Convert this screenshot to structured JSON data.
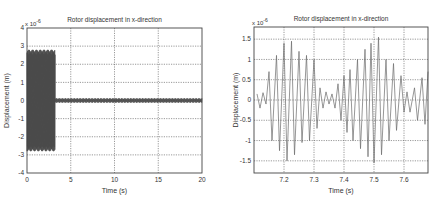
{
  "chart_data": [
    {
      "type": "line",
      "title": "Rotor displacement in x-direction",
      "xlabel": "Time (s)",
      "ylabel": "Displacement (m)",
      "y_multiplier": "x 10^-6",
      "xlim": [
        0,
        20
      ],
      "ylim": [
        -4,
        4
      ],
      "xticks": [
        0,
        5,
        10,
        15,
        20
      ],
      "yticks": [
        4,
        3,
        2,
        1,
        0,
        -1,
        -2,
        -3,
        -4
      ],
      "grid": true,
      "description": "Dense high-frequency oscillation with amplitude about ±2.8e-6 m from t=0 to ~3.2 s, then abruptly drops to a small residual oscillation of about ±0.1e-6 m until t=20 s",
      "segments": [
        {
          "t_start": 0,
          "t_end": 3.2,
          "amplitude": 2.8
        },
        {
          "t_start": 3.2,
          "t_end": 20,
          "amplitude": 0.12
        }
      ]
    },
    {
      "type": "line",
      "title": "Rotor displacement in x-direction",
      "xlabel": "Time (s)",
      "ylabel": "Displacement (m)",
      "y_multiplier": "x 10^-6",
      "xlim": [
        7.1,
        7.68
      ],
      "ylim": [
        -1.8,
        1.8
      ],
      "xticks": [
        7.2,
        7.3,
        7.4,
        7.5,
        7.6
      ],
      "yticks": [
        1.5,
        1,
        0.5,
        0,
        -0.5,
        -1,
        -1.5
      ],
      "grid": true,
      "description": "Zoomed view showing beating oscillation: low-amplitude noise near 0, then bursts reaching about ±1.5e-6 m around t=7.2 and t=7.5 s",
      "peaks": [
        {
          "t": 7.11,
          "v": 0.15
        },
        {
          "t": 7.12,
          "v": -0.2
        },
        {
          "t": 7.13,
          "v": 0.18
        },
        {
          "t": 7.14,
          "v": -0.1
        },
        {
          "t": 7.15,
          "v": 0.7
        },
        {
          "t": 7.16,
          "v": -1.0
        },
        {
          "t": 7.175,
          "v": 1.1
        },
        {
          "t": 7.185,
          "v": -1.25
        },
        {
          "t": 7.2,
          "v": 1.4
        },
        {
          "t": 7.21,
          "v": -1.5
        },
        {
          "t": 7.225,
          "v": 1.45
        },
        {
          "t": 7.235,
          "v": -1.35
        },
        {
          "t": 7.25,
          "v": 1.2
        },
        {
          "t": 7.26,
          "v": -1.05
        },
        {
          "t": 7.275,
          "v": 1.1
        },
        {
          "t": 7.285,
          "v": -1.0
        },
        {
          "t": 7.3,
          "v": 1.0
        },
        {
          "t": 7.31,
          "v": -0.7
        },
        {
          "t": 7.32,
          "v": 0.3
        },
        {
          "t": 7.33,
          "v": -0.2
        },
        {
          "t": 7.34,
          "v": 0.2
        },
        {
          "t": 7.35,
          "v": -0.1
        },
        {
          "t": 7.36,
          "v": 0.15
        },
        {
          "t": 7.37,
          "v": -0.2
        },
        {
          "t": 7.38,
          "v": 0.4
        },
        {
          "t": 7.39,
          "v": -0.5
        },
        {
          "t": 7.4,
          "v": 0.6
        },
        {
          "t": 7.41,
          "v": -0.8
        },
        {
          "t": 7.42,
          "v": 0.75
        },
        {
          "t": 7.43,
          "v": -1.0
        },
        {
          "t": 7.445,
          "v": 1.0
        },
        {
          "t": 7.455,
          "v": -1.2
        },
        {
          "t": 7.47,
          "v": 1.25
        },
        {
          "t": 7.48,
          "v": -1.4
        },
        {
          "t": 7.49,
          "v": 1.4
        },
        {
          "t": 7.5,
          "v": -1.55
        },
        {
          "t": 7.515,
          "v": 1.55
        },
        {
          "t": 7.525,
          "v": -1.35
        },
        {
          "t": 7.54,
          "v": 1.0
        },
        {
          "t": 7.55,
          "v": -1.0
        },
        {
          "t": 7.565,
          "v": 0.9
        },
        {
          "t": 7.575,
          "v": -0.75
        },
        {
          "t": 7.59,
          "v": 0.6
        },
        {
          "t": 7.6,
          "v": -0.3
        },
        {
          "t": 7.61,
          "v": 0.2
        },
        {
          "t": 7.62,
          "v": -0.3
        },
        {
          "t": 7.635,
          "v": 0.3
        },
        {
          "t": 7.645,
          "v": -0.5
        },
        {
          "t": 7.66,
          "v": 0.55
        },
        {
          "t": 7.67,
          "v": -0.6
        },
        {
          "t": 7.68,
          "v": 0.7
        }
      ]
    }
  ]
}
